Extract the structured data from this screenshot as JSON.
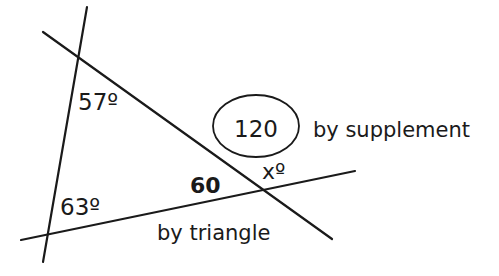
{
  "diagram": {
    "type": "geometry",
    "lines": [
      {
        "id": "steep-line",
        "x1": 87,
        "y1": 7,
        "x2": 43,
        "y2": 262
      },
      {
        "id": "diagonal-line",
        "x1": 43,
        "y1": 32,
        "x2": 332,
        "y2": 239
      },
      {
        "id": "bottom-line",
        "x1": 21,
        "y1": 240,
        "x2": 355,
        "y2": 171
      }
    ],
    "circled_value": {
      "cx": 256,
      "cy": 126,
      "rx": 43,
      "ry": 31,
      "text": "120"
    },
    "labels": {
      "angle_top": "57º",
      "angle_bottom": "63º",
      "interior_angle": "60",
      "unknown_angle": "xº",
      "supplement_note": "by supplement",
      "triangle_note": "by triangle"
    },
    "color": "#1a1a1a"
  }
}
